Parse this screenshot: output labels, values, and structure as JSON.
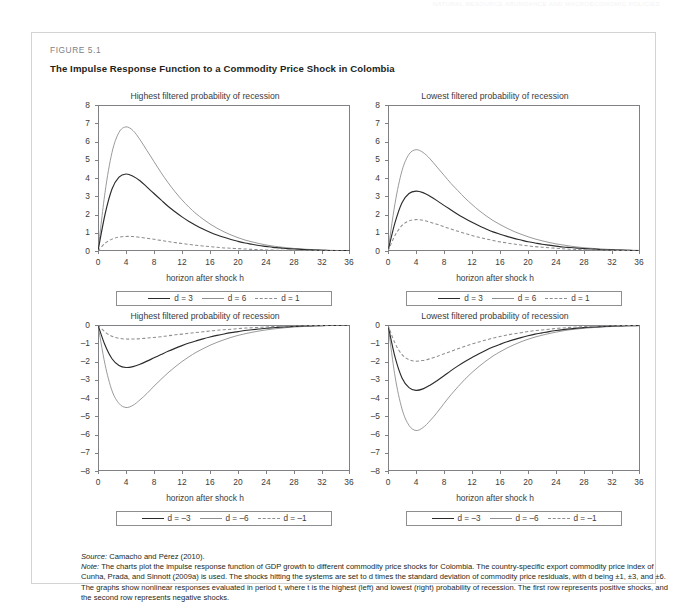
{
  "running_head": "NATURAL RESOURCE ABUNDANCE AND MACROECONOMIC POLICIES",
  "figure": {
    "label": "FIGURE 5.1",
    "title": "The Impulse Response Function to a Commodity Price Shock in Colombia"
  },
  "axis": {
    "x_title": "horizon after shock h",
    "x_ticks": [
      "0",
      "4",
      "8",
      "12",
      "16",
      "20",
      "24",
      "28",
      "32",
      "36"
    ],
    "y_ticks_positive": [
      "8",
      "7",
      "6",
      "5",
      "4",
      "3",
      "2",
      "1",
      "0"
    ],
    "y_ticks_negative": [
      "0",
      "–1",
      "–2",
      "–3",
      "–4",
      "–5",
      "–6",
      "–7",
      "–8"
    ]
  },
  "legends": {
    "positive": [
      {
        "label": "d = 3",
        "style": "solid-dark"
      },
      {
        "label": "d = 6",
        "style": "solid-gray"
      },
      {
        "label": "d = 1",
        "style": "dashed-gray"
      }
    ],
    "negative": [
      {
        "label": "d = –3",
        "style": "solid-dark"
      },
      {
        "label": "d = –6",
        "style": "solid-gray"
      },
      {
        "label": "d = –1",
        "style": "dashed-gray"
      }
    ]
  },
  "source_prefix": "Source:",
  "source_text": " Camacho and Pérez (2010).",
  "note_prefix": "Note:",
  "note_text": " The charts plot the impulse response function of GDP growth to different commodity price shocks for Colombia. The country-specific export commodity price index of Cunha, Prada, and Sinnott (2009a) is used. The shocks hitting the systems are set to d times the standard deviation of commodity price residuals, with d being ±1, ±3, and ±6. The graphs show nonlinear responses evaluated in period t, where t is the highest (left) and lowest (right) probability of recession. The first row represents positive shocks, and the second row represents negative shocks.",
  "colors": {
    "dark_line": "#2b2b2b",
    "gray_line": "#8d8e90",
    "frame": "#808184",
    "text": "#231f20",
    "muted_text": "#3b3b3d",
    "box_border": "#d2d3d5"
  },
  "chart_data": [
    {
      "id": "top-left",
      "type": "line",
      "title": "Highest filtered probability of recession",
      "xlabel": "horizon after shock h",
      "ylabel": "",
      "xlim": [
        0,
        36
      ],
      "ylim": [
        0,
        8
      ],
      "grid": false,
      "legend_position": "below",
      "x": [
        0,
        1,
        2,
        3,
        4,
        5,
        6,
        7,
        8,
        9,
        10,
        11,
        12,
        13,
        14,
        15,
        16,
        17,
        18,
        19,
        20,
        21,
        22,
        23,
        24,
        25,
        26,
        27,
        28,
        29,
        30,
        31,
        32,
        33,
        34,
        35,
        36
      ],
      "series": [
        {
          "name": "d = 6",
          "style": "solid-gray",
          "values": [
            0,
            3.2,
            5.4,
            6.5,
            6.8,
            6.6,
            6.1,
            5.5,
            4.9,
            4.3,
            3.75,
            3.25,
            2.8,
            2.4,
            2.05,
            1.75,
            1.48,
            1.25,
            1.05,
            0.88,
            0.73,
            0.6,
            0.5,
            0.41,
            0.33,
            0.27,
            0.22,
            0.18,
            0.14,
            0.11,
            0.09,
            0.07,
            0.055,
            0.04,
            0.03,
            0.02,
            0.015
          ]
        },
        {
          "name": "d = 3",
          "style": "solid-dark",
          "values": [
            0,
            2.0,
            3.4,
            4.05,
            4.22,
            4.1,
            3.85,
            3.5,
            3.15,
            2.8,
            2.45,
            2.15,
            1.87,
            1.62,
            1.4,
            1.2,
            1.03,
            0.88,
            0.75,
            0.63,
            0.53,
            0.44,
            0.37,
            0.3,
            0.25,
            0.2,
            0.17,
            0.13,
            0.11,
            0.09,
            0.07,
            0.055,
            0.04,
            0.03,
            0.025,
            0.02,
            0.015
          ]
        },
        {
          "name": "d = 1",
          "style": "dashed-gray",
          "values": [
            0,
            0.42,
            0.65,
            0.76,
            0.8,
            0.79,
            0.75,
            0.7,
            0.64,
            0.58,
            0.52,
            0.46,
            0.41,
            0.36,
            0.31,
            0.27,
            0.24,
            0.2,
            0.17,
            0.15,
            0.13,
            0.11,
            0.09,
            0.075,
            0.06,
            0.05,
            0.04,
            0.035,
            0.028,
            0.022,
            0.018,
            0.014,
            0.011,
            0.009,
            0.007,
            0.005,
            0.004
          ]
        }
      ]
    },
    {
      "id": "top-right",
      "type": "line",
      "title": "Lowest filtered probability of recession",
      "xlabel": "horizon after shock h",
      "ylabel": "",
      "xlim": [
        0,
        36
      ],
      "ylim": [
        0,
        8
      ],
      "grid": false,
      "legend_position": "below",
      "x": [
        0,
        1,
        2,
        3,
        4,
        5,
        6,
        7,
        8,
        9,
        10,
        11,
        12,
        13,
        14,
        15,
        16,
        17,
        18,
        19,
        20,
        21,
        22,
        23,
        24,
        25,
        26,
        27,
        28,
        29,
        30,
        31,
        32,
        33,
        34,
        35,
        36
      ],
      "series": [
        {
          "name": "d = 6",
          "style": "solid-gray",
          "values": [
            0,
            2.6,
            4.4,
            5.3,
            5.55,
            5.4,
            5.05,
            4.6,
            4.15,
            3.7,
            3.3,
            2.9,
            2.55,
            2.22,
            1.93,
            1.67,
            1.45,
            1.25,
            1.07,
            0.92,
            0.78,
            0.66,
            0.56,
            0.47,
            0.39,
            0.33,
            0.27,
            0.22,
            0.18,
            0.15,
            0.12,
            0.1,
            0.08,
            0.065,
            0.05,
            0.04,
            0.03
          ]
        },
        {
          "name": "d = 3",
          "style": "solid-dark",
          "values": [
            0,
            1.55,
            2.65,
            3.15,
            3.28,
            3.2,
            3.0,
            2.76,
            2.5,
            2.25,
            2.0,
            1.78,
            1.57,
            1.38,
            1.21,
            1.05,
            0.92,
            0.8,
            0.69,
            0.6,
            0.51,
            0.44,
            0.37,
            0.32,
            0.27,
            0.22,
            0.19,
            0.16,
            0.13,
            0.11,
            0.09,
            0.07,
            0.06,
            0.05,
            0.04,
            0.03,
            0.025
          ]
        },
        {
          "name": "d = 1",
          "style": "dashed-gray",
          "values": [
            0,
            0.85,
            1.4,
            1.65,
            1.72,
            1.68,
            1.58,
            1.46,
            1.33,
            1.2,
            1.08,
            0.96,
            0.85,
            0.75,
            0.66,
            0.58,
            0.5,
            0.44,
            0.38,
            0.33,
            0.28,
            0.24,
            0.21,
            0.18,
            0.15,
            0.12,
            0.1,
            0.085,
            0.07,
            0.06,
            0.05,
            0.04,
            0.032,
            0.026,
            0.021,
            0.017,
            0.013
          ]
        }
      ]
    },
    {
      "id": "bottom-left",
      "type": "line",
      "title": "Highest filtered probability of recession",
      "xlabel": "horizon after shock h",
      "ylabel": "",
      "xlim": [
        0,
        36
      ],
      "ylim": [
        -8,
        0
      ],
      "grid": false,
      "legend_position": "below",
      "x": [
        0,
        1,
        2,
        3,
        4,
        5,
        6,
        7,
        8,
        9,
        10,
        11,
        12,
        13,
        14,
        15,
        16,
        17,
        18,
        19,
        20,
        21,
        22,
        23,
        24,
        25,
        26,
        27,
        28,
        29,
        30,
        31,
        32,
        33,
        34,
        35,
        36
      ],
      "series": [
        {
          "name": "d = –6",
          "style": "solid-gray",
          "values": [
            0,
            -2.15,
            -3.6,
            -4.3,
            -4.52,
            -4.4,
            -4.1,
            -3.75,
            -3.35,
            -2.98,
            -2.62,
            -2.3,
            -2.0,
            -1.74,
            -1.5,
            -1.3,
            -1.11,
            -0.95,
            -0.81,
            -0.68,
            -0.57,
            -0.48,
            -0.4,
            -0.33,
            -0.27,
            -0.22,
            -0.18,
            -0.14,
            -0.11,
            -0.09,
            -0.07,
            -0.055,
            -0.04,
            -0.03,
            -0.025,
            -0.02,
            -0.015
          ]
        },
        {
          "name": "d = –3",
          "style": "solid-dark",
          "values": [
            0,
            -1.1,
            -1.85,
            -2.22,
            -2.33,
            -2.28,
            -2.15,
            -1.98,
            -1.8,
            -1.62,
            -1.44,
            -1.28,
            -1.13,
            -0.99,
            -0.87,
            -0.76,
            -0.66,
            -0.57,
            -0.49,
            -0.42,
            -0.36,
            -0.3,
            -0.26,
            -0.22,
            -0.18,
            -0.15,
            -0.12,
            -0.1,
            -0.08,
            -0.065,
            -0.05,
            -0.04,
            -0.032,
            -0.025,
            -0.02,
            -0.015,
            -0.012
          ]
        },
        {
          "name": "d = –1",
          "style": "dashed-gray",
          "values": [
            0,
            -0.38,
            -0.62,
            -0.73,
            -0.77,
            -0.77,
            -0.75,
            -0.72,
            -0.68,
            -0.64,
            -0.59,
            -0.54,
            -0.5,
            -0.45,
            -0.41,
            -0.37,
            -0.33,
            -0.29,
            -0.26,
            -0.23,
            -0.2,
            -0.17,
            -0.15,
            -0.13,
            -0.11,
            -0.09,
            -0.075,
            -0.06,
            -0.05,
            -0.04,
            -0.033,
            -0.027,
            -0.022,
            -0.018,
            -0.014,
            -0.011,
            -0.009
          ]
        }
      ]
    },
    {
      "id": "bottom-right",
      "type": "line",
      "title": "Lowest filtered probability of recession",
      "xlabel": "horizon after shock h",
      "ylabel": "",
      "xlim": [
        0,
        36
      ],
      "ylim": [
        -8,
        0
      ],
      "grid": false,
      "legend_position": "below",
      "x": [
        0,
        1,
        2,
        3,
        4,
        5,
        6,
        7,
        8,
        9,
        10,
        11,
        12,
        13,
        14,
        15,
        16,
        17,
        18,
        19,
        20,
        21,
        22,
        23,
        24,
        25,
        26,
        27,
        28,
        29,
        30,
        31,
        32,
        33,
        34,
        35,
        36
      ],
      "series": [
        {
          "name": "d = –6",
          "style": "solid-gray",
          "values": [
            0,
            -2.8,
            -4.6,
            -5.5,
            -5.78,
            -5.62,
            -5.25,
            -4.8,
            -4.3,
            -3.82,
            -3.38,
            -2.97,
            -2.6,
            -2.27,
            -1.97,
            -1.7,
            -1.47,
            -1.26,
            -1.08,
            -0.92,
            -0.78,
            -0.66,
            -0.56,
            -0.47,
            -0.39,
            -0.32,
            -0.26,
            -0.22,
            -0.18,
            -0.15,
            -0.12,
            -0.1,
            -0.08,
            -0.065,
            -0.05,
            -0.04,
            -0.03
          ]
        },
        {
          "name": "d = –3",
          "style": "solid-dark",
          "values": [
            0,
            -1.75,
            -2.9,
            -3.43,
            -3.58,
            -3.5,
            -3.3,
            -3.05,
            -2.78,
            -2.5,
            -2.24,
            -2.0,
            -1.78,
            -1.57,
            -1.38,
            -1.21,
            -1.06,
            -0.92,
            -0.8,
            -0.69,
            -0.59,
            -0.5,
            -0.43,
            -0.36,
            -0.3,
            -0.25,
            -0.21,
            -0.17,
            -0.14,
            -0.12,
            -0.1,
            -0.08,
            -0.065,
            -0.05,
            -0.04,
            -0.033,
            -0.026
          ]
        },
        {
          "name": "d = –1",
          "style": "dashed-gray",
          "values": [
            0,
            -1.0,
            -1.62,
            -1.9,
            -1.98,
            -1.94,
            -1.85,
            -1.72,
            -1.58,
            -1.44,
            -1.3,
            -1.17,
            -1.04,
            -0.93,
            -0.82,
            -0.72,
            -0.63,
            -0.55,
            -0.48,
            -0.42,
            -0.36,
            -0.31,
            -0.27,
            -0.23,
            -0.19,
            -0.16,
            -0.13,
            -0.11,
            -0.09,
            -0.075,
            -0.06,
            -0.05,
            -0.04,
            -0.033,
            -0.026,
            -0.021,
            -0.017
          ]
        }
      ]
    }
  ]
}
